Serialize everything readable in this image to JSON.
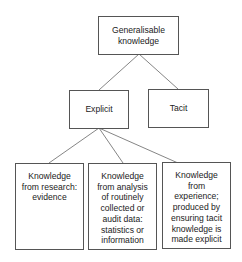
{
  "diagram": {
    "type": "hierarchy-tree",
    "root": {
      "label": "Generalisable knowledge",
      "lines": [
        "Generalisable",
        "knowledge"
      ]
    },
    "level2": [
      {
        "label": "Explicit"
      },
      {
        "label": "Tacit"
      }
    ],
    "level3": [
      {
        "parent": "Explicit",
        "lines": [
          "Knowledge",
          "from research:",
          "evidence"
        ]
      },
      {
        "parent": "Explicit",
        "lines": [
          "Knowledge",
          "from analysis",
          "of routinely",
          "collected or",
          "audit data:",
          "statistics or",
          "information"
        ]
      },
      {
        "parent": "Explicit",
        "lines": [
          "Knowledge",
          "from",
          "experience;",
          "produced by",
          "ensuring tacit",
          "knowledge is",
          "made explicit"
        ]
      }
    ],
    "colors": {
      "border": "#555555",
      "line": "#666666",
      "text": "#222222",
      "background": "#ffffff"
    }
  }
}
